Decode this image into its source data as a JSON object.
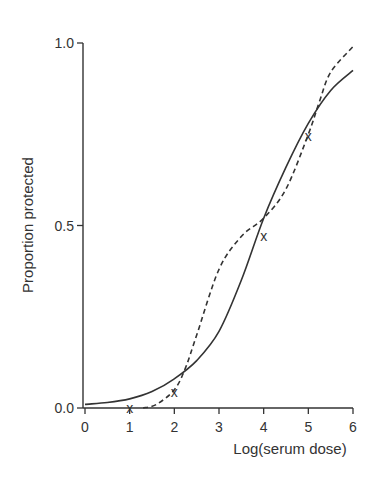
{
  "chart_data": {
    "type": "line",
    "title": "",
    "xlabel": "Log(serum dose)",
    "ylabel": "Proportion protected",
    "xlim": [
      0,
      6
    ],
    "ylim": [
      0,
      1
    ],
    "x_ticks": [
      0,
      1,
      2,
      3,
      4,
      5,
      6
    ],
    "x_tick_labels": [
      "0",
      "1",
      "2",
      "3",
      "4",
      "5",
      "6"
    ],
    "y_ticks": [
      0.0,
      0.5,
      1.0
    ],
    "y_tick_labels": [
      "0.0",
      "0.5",
      "1.0"
    ],
    "grid": false,
    "legend": null,
    "series": [
      {
        "name": "fitted curve (solid)",
        "style": "solid",
        "color": "#333333",
        "x": [
          0,
          0.5,
          1,
          1.5,
          2,
          2.5,
          3,
          3.5,
          4,
          4.5,
          5,
          5.5,
          6
        ],
        "values": [
          0.01,
          0.015,
          0.025,
          0.045,
          0.08,
          0.13,
          0.21,
          0.35,
          0.52,
          0.66,
          0.78,
          0.87,
          0.925
        ]
      },
      {
        "name": "fitted curve (dashed)",
        "style": "dashed",
        "color": "#333333",
        "x": [
          1.3,
          1.6,
          2,
          2.25,
          2.5,
          3,
          3.5,
          4,
          4.5,
          5,
          5.25,
          5.5,
          6
        ],
        "values": [
          0.0,
          0.01,
          0.05,
          0.11,
          0.2,
          0.38,
          0.47,
          0.52,
          0.6,
          0.75,
          0.84,
          0.92,
          0.99
        ]
      }
    ],
    "points": {
      "name": "observed",
      "marker": "x",
      "x": [
        1,
        2,
        4,
        5
      ],
      "values": [
        0.0,
        0.045,
        0.47,
        0.745
      ]
    }
  }
}
